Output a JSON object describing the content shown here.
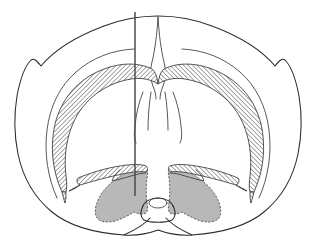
{
  "figure": {
    "kind": "coronal-brain-section-diagram",
    "width": 316,
    "height": 245,
    "background_color": "#ffffff",
    "caption": ""
  },
  "palette": {
    "outline_stroke": "#2b2b2b",
    "inner_stroke": "#3a3a3a",
    "hatch_stroke": "#2b2b2b",
    "hatch_fill": "#ffffff",
    "nucleus_fill": "#b8b8b8",
    "nucleus_stroke": "#4a4a4a",
    "probe_color": "#4d4d4d"
  },
  "structures": {
    "brain_outline": {
      "name": "cerebral-hemispheres-outline",
      "path": "M 158 16 C 140 16 122 19 104 26 C 80 35 56 48 41 66 C 36 60 34 58 31 60 C 25 66 20 80 17 96 C 14 114 14 134 18 154 C 23 178 35 198 52 212 C 70 227 96 233 124 235 C 140 236 150 233 158 230 C 166 233 176 236 192 235 C 220 233 246 227 264 212 C 281 198 293 178 298 154 C 302 134 302 114 299 96 C 296 80 291 66 285 60 C 282 58 280 60 275 66 C 260 48 236 35 212 26 C 194 19 176 16 158 16 Z"
    },
    "midline_fissure": {
      "name": "interhemispheric-fissure",
      "path": "M 158 17 C 157 34 155 50 152 62 C 150 70 150 78 153 86 C 155 91 156 95 156 99 M 158 17 C 159 34 161 50 164 62 C 166 70 166 78 163 86 C 161 91 160 95 160 99"
    },
    "cortex_inner_left": {
      "name": "cortex-inner-boundary-left",
      "path": "M 57 198 C 48 178 44 154 47 130 C 50 106 60 86 76 72 C 92 58 112 50 134 49"
    },
    "cortex_inner_right": {
      "name": "cortex-inner-boundary-right",
      "path": "M 259 198 C 268 178 272 154 269 130 C 266 106 256 86 240 72 C 224 58 204 50 182 49"
    },
    "corpus_callosum": {
      "name": "corpus-callosum-hatched-band",
      "left_path": "M 62 192 C 52 170 50 146 55 124 C 61 100 76 82 97 72 C 114 64 133 61 150 68 C 155 70 157 76 158 84 C 152 80 142 77 131 79 C 112 82 94 92 82 108 C 69 125 63 150 66 176 C 67 183 67 188 66 192 Z",
      "right_path": "M 254 192 C 264 170 266 146 261 124 C 255 100 240 82 219 72 C 202 64 183 61 166 68 C 161 70 159 76 158 84 C 164 80 174 77 185 79 C 204 82 222 92 234 108 C 247 125 253 150 250 176 C 249 183 249 188 250 192 Z",
      "left_tip_path": "M 62 192 C 63 196 64 200 65 203 C 66 200 66 196 66 192 Z",
      "right_tip_path": "M 254 192 C 253 196 252 200 251 203 C 250 200 250 196 250 192 Z"
    },
    "septum_ventricle": {
      "name": "septum-lateral-ventricle",
      "left_path": "M 143 92 C 139 102 136 114 135 126 C 134 134 134 139 136 143 M 151 92 C 149 104 148 118 148 130",
      "right_path": "M 173 92 C 177 102 180 114 181 126 C 182 134 182 139 180 143 M 165 92 C 167 104 168 118 168 130"
    },
    "anterior_commissure": {
      "name": "anterior-commissure-hatched",
      "left_path": "M 78 178 C 90 173 106 168 120 166 C 132 164 141 164 146 166 C 148 167 148 170 146 172 C 140 171 130 172 118 175 C 104 178 90 182 80 185 C 77 184 76 180 78 178 Z",
      "right_path": "M 238 178 C 226 173 210 168 196 166 C 184 164 175 164 170 166 C 168 167 168 170 170 172 C 176 171 186 172 198 175 C 212 178 226 182 236 185 C 239 184 240 180 238 178 Z",
      "left_tip_path": "M 80 185 C 76 187 72 189 69 191 C 73 190 77 187 80 185 Z",
      "right_tip_path": "M 236 185 C 240 187 244 189 247 191 C 243 190 239 187 236 185 Z"
    },
    "striatum_left": {
      "name": "striatum-caudate-putamen-left",
      "path": "M 146 168 C 137 168 127 171 119 177 C 110 183 103 190 99 198 C 95 206 94 213 97 218 C 100 222 107 223 115 221 C 122 219 129 215 134 212 C 138 214 143 215 146 213 C 148 211 148 207 147 203 C 146 196 146 186 147 178 C 148 173 148 169 146 168 Z",
      "inner_notch_path": "M 120 170 C 116 173 113 177 112 181 C 117 180 124 178 131 176 C 137 174 142 173 146 173"
    },
    "striatum_right": {
      "name": "striatum-caudate-putamen-right",
      "path": "M 170 168 C 179 168 189 171 197 177 C 206 183 213 190 217 198 C 221 206 222 213 219 218 C 216 222 209 223 201 221 C 194 219 187 215 182 212 C 178 214 173 215 170 213 C 168 211 168 207 169 203 C 170 196 170 186 169 178 C 168 173 168 169 170 168 Z",
      "inner_notch_path": "M 196 170 C 200 173 203 177 204 181 C 199 180 192 178 185 176 C 179 174 174 173 170 173"
    },
    "hypothalamus": {
      "name": "ventral-hypothalamus-outline",
      "path": "M 158 198 C 150 198 144 202 142 208 C 140 213 141 218 144 220 C 150 223 166 223 172 220 C 175 218 176 213 174 208 C 172 202 166 198 158 198 Z"
    },
    "optic_chiasm": {
      "name": "optic-chiasm-oval",
      "cx": 158,
      "cy": 203,
      "rx": 9,
      "ry": 5
    },
    "ventral_surface": {
      "name": "ventral-brain-surface",
      "path": "M 124 235 C 135 230 145 224 150 218 M 192 235 C 181 230 171 224 166 218"
    }
  },
  "probe": {
    "name": "electrode-probe-track",
    "label": "",
    "x": 135,
    "y_top": 12,
    "y_bottom": 196,
    "color": "#4d4d4d",
    "width": 1.5
  },
  "annotations": {
    "labels": []
  }
}
